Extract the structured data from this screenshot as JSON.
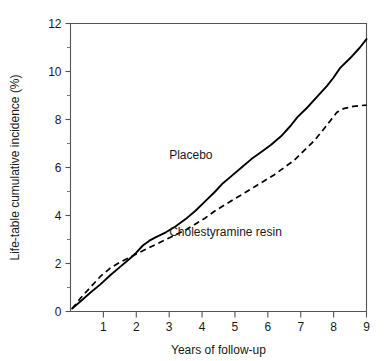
{
  "chart_data": {
    "type": "line",
    "title": "",
    "subtitle": "",
    "xlabel": "Years of follow-up",
    "ylabel": "Life-table cumulative incidence (%)",
    "xlim": [
      0,
      9
    ],
    "ylim": [
      0,
      12
    ],
    "grid": false,
    "legend_position": "inline-annotation",
    "x_ticks": [
      0,
      1,
      2,
      3,
      4,
      5,
      6,
      7,
      8,
      9
    ],
    "x_tick_labels": [
      "",
      "1",
      "2",
      "3",
      "4",
      "5",
      "6",
      "7",
      "8",
      "9"
    ],
    "y_ticks": [
      0,
      2,
      4,
      6,
      8,
      10,
      12
    ],
    "y_tick_labels": [
      "0",
      "2",
      "4",
      "6",
      "8",
      "10",
      "12"
    ],
    "y_minor_ticks": [
      1,
      3,
      5,
      7,
      9,
      11
    ],
    "annotations": [
      {
        "text": "Placebo",
        "x": 3.0,
        "y": 6.35
      },
      {
        "text": "Cholestyramine resin",
        "x": 3.0,
        "y": 3.15
      }
    ],
    "series": [
      {
        "name": "Placebo",
        "style": "solid",
        "color": "#000000",
        "x": [
          0.05,
          0.3,
          0.6,
          0.9,
          1.2,
          1.5,
          1.8,
          2.0,
          2.2,
          2.4,
          2.6,
          2.9,
          3.2,
          3.5,
          3.8,
          4.1,
          4.4,
          4.6,
          4.9,
          5.2,
          5.5,
          5.8,
          6.1,
          6.4,
          6.7,
          6.9,
          7.2,
          7.5,
          7.8,
          8.0,
          8.2,
          8.5,
          8.8,
          9.0
        ],
        "y": [
          0.12,
          0.42,
          0.78,
          1.12,
          1.5,
          1.85,
          2.2,
          2.45,
          2.75,
          2.95,
          3.1,
          3.3,
          3.55,
          3.85,
          4.2,
          4.6,
          5.0,
          5.3,
          5.65,
          6.0,
          6.35,
          6.65,
          6.95,
          7.3,
          7.75,
          8.1,
          8.5,
          8.95,
          9.4,
          9.75,
          10.15,
          10.55,
          11.0,
          11.35
        ]
      },
      {
        "name": "Cholestyramine resin",
        "style": "dashed",
        "color": "#000000",
        "x": [
          0.05,
          0.3,
          0.6,
          0.9,
          1.2,
          1.5,
          1.8,
          2.0,
          2.3,
          2.6,
          2.9,
          3.2,
          3.5,
          3.8,
          4.1,
          4.4,
          4.7,
          5.0,
          5.3,
          5.6,
          5.9,
          6.2,
          6.5,
          6.8,
          7.1,
          7.4,
          7.7,
          7.9,
          8.1,
          8.3,
          8.6,
          9.0
        ],
        "y": [
          0.12,
          0.55,
          1.0,
          1.45,
          1.8,
          2.05,
          2.25,
          2.4,
          2.6,
          2.8,
          3.0,
          3.2,
          3.4,
          3.65,
          3.9,
          4.2,
          4.45,
          4.7,
          4.95,
          5.2,
          5.45,
          5.7,
          6.0,
          6.3,
          6.7,
          7.1,
          7.6,
          7.95,
          8.3,
          8.45,
          8.55,
          8.6
        ]
      }
    ]
  }
}
